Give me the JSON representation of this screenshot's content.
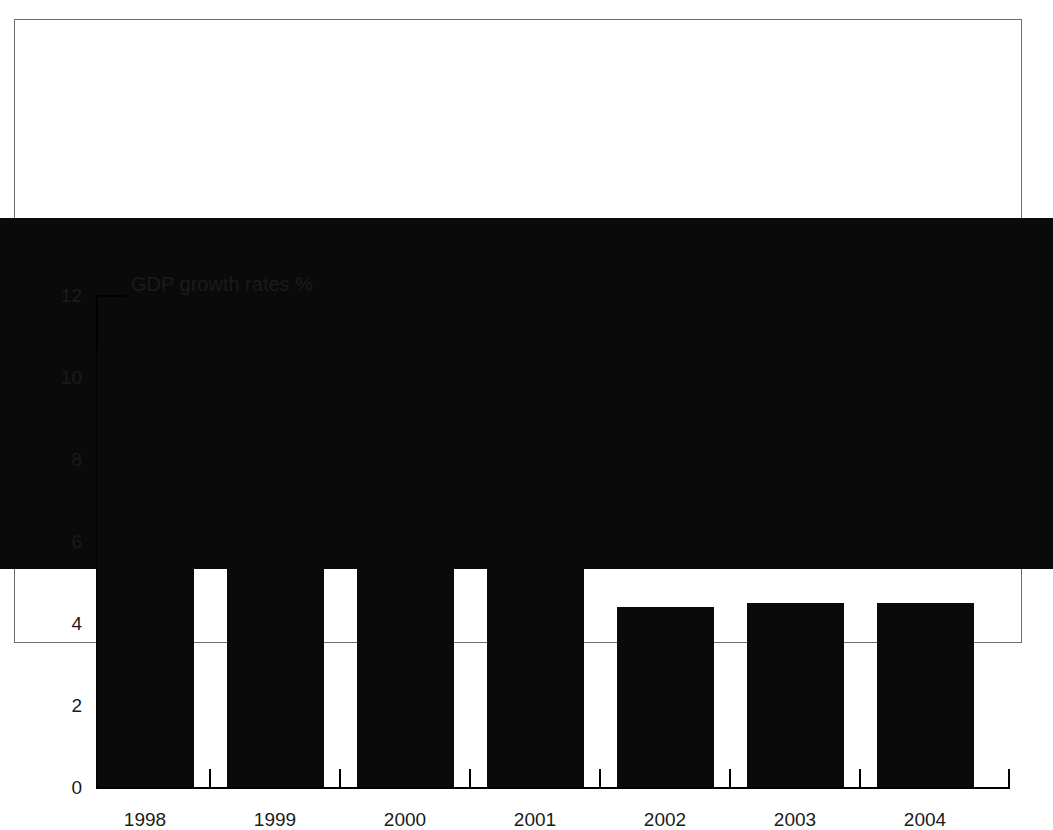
{
  "figure": {
    "caption_remnant": "",
    "frame_color": "#6e6e72",
    "bar_color": "#0a0a0a",
    "text_color": "#1b1b1b"
  },
  "chart_data": {
    "type": "bar",
    "title": "GDP growth rates %",
    "xlabel": "",
    "ylabel": "",
    "categories": [
      "1998",
      "1999",
      "2000",
      "2001",
      "2002",
      "2003",
      "2004"
    ],
    "values": [
      8.55,
      10.75,
      9.25,
      6.2,
      6.1,
      4.4,
      4.5
    ],
    "ylim": [
      0,
      12
    ],
    "yticks": [
      0,
      2,
      4,
      6,
      8,
      10,
      12
    ],
    "ytick_labels": [
      "0",
      "2",
      "4",
      "6",
      "8",
      "10",
      "12"
    ],
    "grid": false,
    "legend": null,
    "series": [
      {
        "name": "GDP growth rates %",
        "values": [
          8.55,
          10.75,
          9.25,
          6.2,
          6.1,
          4.4,
          4.5
        ]
      }
    ]
  }
}
